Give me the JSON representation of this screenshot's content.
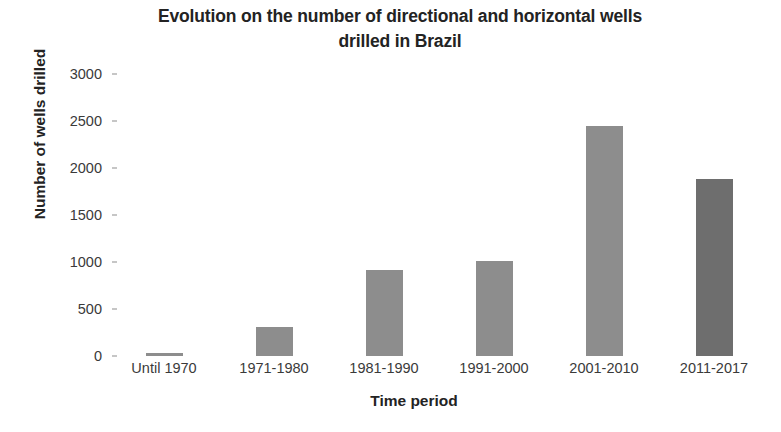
{
  "chart_data": {
    "type": "bar",
    "title": "Evolution on the number of directional and horizontal wells drilled in Brazil",
    "title_line1": "Evolution on the number of directional and horizontal wells",
    "title_line2": "drilled in Brazil",
    "xlabel": "Time period",
    "ylabel": "Number of wells drilled",
    "categories": [
      "Until 1970",
      "1971-1980",
      "1981-1990",
      "1991-2000",
      "2001-2010",
      "2011-2017"
    ],
    "values": [
      30,
      310,
      915,
      1010,
      2445,
      1885
    ],
    "ylim": [
      0,
      3000
    ],
    "yticks": [
      0,
      500,
      1000,
      1500,
      2000,
      2500,
      3000
    ],
    "ytick_labels": [
      "0",
      "500",
      "1000",
      "1500",
      "2000",
      "2500",
      "3000"
    ],
    "grid": false,
    "legend": false,
    "bar_colors": [
      "#8d8d8d",
      "#8d8d8d",
      "#8d8d8d",
      "#8d8d8d",
      "#8d8d8d",
      "#6e6e6e"
    ],
    "series": [
      {
        "name": "Wells drilled",
        "values": [
          30,
          310,
          915,
          1010,
          2445,
          1885
        ]
      }
    ],
    "points": [
      {
        "category": "Until 1970",
        "value": 30
      },
      {
        "category": "1971-1980",
        "value": 310
      },
      {
        "category": "1981-1990",
        "value": 915
      },
      {
        "category": "1991-2000",
        "value": 1010
      },
      {
        "category": "2001-2010",
        "value": 2445
      },
      {
        "category": "2011-2017",
        "value": 1885
      }
    ]
  }
}
